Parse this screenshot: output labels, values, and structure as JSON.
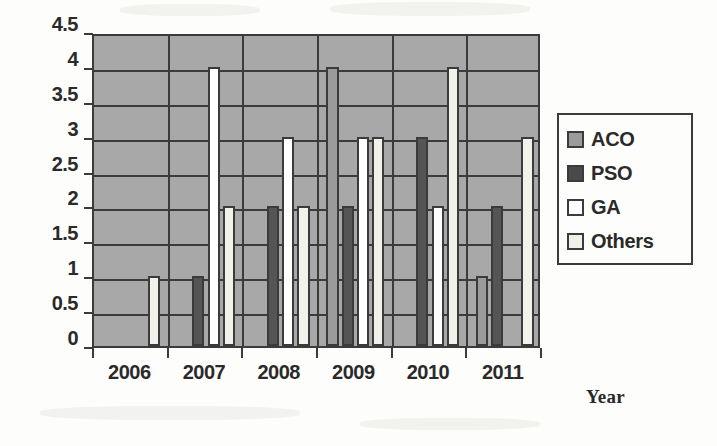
{
  "chart_data": {
    "type": "bar",
    "title": "",
    "xlabel": "Year",
    "ylabel": "",
    "categories": [
      "2006",
      "2007",
      "2008",
      "2009",
      "2010",
      "2011"
    ],
    "series": [
      {
        "name": "ACO",
        "color": "#9b9b9b",
        "values": [
          0,
          0,
          0,
          4,
          0,
          1
        ]
      },
      {
        "name": "PSO",
        "color": "#555555",
        "values": [
          0,
          1,
          2,
          2,
          3,
          2
        ]
      },
      {
        "name": "GA",
        "color": "#ffffff",
        "values": [
          0,
          4,
          3,
          3,
          2,
          0
        ]
      },
      {
        "name": "Others",
        "color": "#f2f2ea",
        "values": [
          1,
          2,
          2,
          3,
          4,
          3
        ]
      }
    ],
    "ylim": [
      0,
      4.5
    ],
    "ytick_labels": [
      "4.5",
      "4",
      "3.5",
      "3",
      "2.5",
      "2",
      "1.5",
      "1",
      "0.5",
      "0"
    ],
    "ytick_values": [
      4.5,
      4,
      3.5,
      3,
      2.5,
      2,
      1.5,
      1,
      0.5,
      0
    ],
    "grid": true,
    "legend_position": "right",
    "plot_background": "#a8a8a8",
    "axis_color": "#3b3b3b"
  },
  "legend": {
    "items": [
      {
        "label": "ACO",
        "swatch": "aco"
      },
      {
        "label": "PSO",
        "swatch": "pso"
      },
      {
        "label": "GA",
        "swatch": "ga"
      },
      {
        "label": "Others",
        "swatch": "others"
      }
    ]
  },
  "axis": {
    "x_title": "Year"
  }
}
